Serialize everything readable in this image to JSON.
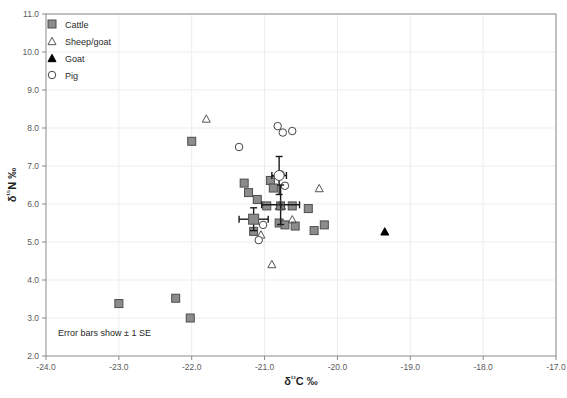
{
  "chart_data": {
    "type": "scatter",
    "title": "",
    "xlabel": "δ¹³C ‰",
    "ylabel": "δ¹⁵N ‰",
    "xlim": [
      -24.0,
      -17.0
    ],
    "ylim": [
      2.0,
      11.0
    ],
    "xticks": [
      "-24.0",
      "-23.0",
      "-22.0",
      "-21.0",
      "-20.0",
      "-19.0",
      "-18.0",
      "-17.0"
    ],
    "yticks": [
      "2.0",
      "3.0",
      "4.0",
      "5.0",
      "6.0",
      "7.0",
      "8.0",
      "9.0",
      "10.0",
      "11.0"
    ],
    "grid": true,
    "legend_position": "top-left",
    "annotation": "Error bars show ± 1 SE",
    "series": [
      {
        "name": "Cattle",
        "marker": "filled-square",
        "color": "#8c8c8c",
        "edge_color": "#4d4d4d",
        "points": [
          [
            -23.0,
            3.38
          ],
          [
            -22.22,
            3.52
          ],
          [
            -22.02,
            3.0
          ],
          [
            -22.0,
            7.65
          ],
          [
            -21.28,
            6.55
          ],
          [
            -21.22,
            6.3
          ],
          [
            -21.15,
            5.28
          ],
          [
            -21.1,
            6.12
          ],
          [
            -20.97,
            5.95
          ],
          [
            -20.92,
            6.62
          ],
          [
            -20.88,
            6.42
          ],
          [
            -20.8,
            5.5
          ],
          [
            -20.78,
            5.95
          ],
          [
            -20.72,
            5.45
          ],
          [
            -20.62,
            5.95
          ],
          [
            -20.58,
            5.42
          ],
          [
            -20.4,
            5.88
          ],
          [
            -20.32,
            5.3
          ],
          [
            -20.18,
            5.45
          ]
        ]
      },
      {
        "name": "Sheep/goat",
        "marker": "open-triangle",
        "color": "#ffffff",
        "edge_color": "#555555",
        "points": [
          [
            -21.8,
            8.25
          ],
          [
            -21.05,
            5.2
          ],
          [
            -20.9,
            4.42
          ],
          [
            -20.8,
            5.95
          ],
          [
            -20.62,
            5.6
          ],
          [
            -20.25,
            6.42
          ]
        ]
      },
      {
        "name": "Goat",
        "marker": "filled-triangle",
        "color": "#000000",
        "edge_color": "#000000",
        "points": [
          [
            -19.35,
            5.28
          ]
        ]
      },
      {
        "name": "Pig",
        "marker": "open-circle",
        "color": "#ffffff",
        "edge_color": "#444444",
        "points": [
          [
            -21.35,
            7.5
          ],
          [
            -20.82,
            8.05
          ],
          [
            -20.75,
            7.88
          ],
          [
            -20.62,
            7.92
          ],
          [
            -20.78,
            6.78
          ],
          [
            -20.72,
            6.48
          ],
          [
            -21.02,
            5.45
          ],
          [
            -21.08,
            5.05
          ]
        ]
      }
    ],
    "means": [
      {
        "name": "Cattle mean",
        "marker": "filled-square",
        "x": -21.15,
        "y": 5.6,
        "x_err": 0.2,
        "y_err": 0.3
      },
      {
        "name": "Sheep/goat mean",
        "marker": "open-triangle",
        "x": -20.78,
        "y": 5.98,
        "x_err": 0.26,
        "y_err": 0.52
      },
      {
        "name": "Pig mean",
        "marker": "open-circle",
        "x": -20.8,
        "y": 6.75,
        "x_err": 0.1,
        "y_err": 0.5
      }
    ]
  },
  "legend": {
    "items": [
      {
        "label": "Cattle",
        "marker": "filled-square"
      },
      {
        "label": "Sheep/goat",
        "marker": "open-triangle"
      },
      {
        "label": "Goat",
        "marker": "filled-triangle"
      },
      {
        "label": "Pig",
        "marker": "open-circle"
      }
    ]
  }
}
